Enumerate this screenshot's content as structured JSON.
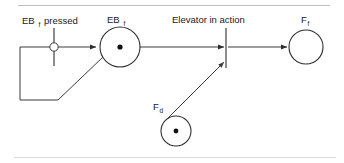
{
  "figure": {
    "type": "petri-net",
    "background_color": "#ffffff",
    "line_color": "#3b3b3b",
    "token_color": "#111111"
  },
  "labels": {
    "eb_pressed_base": "EB",
    "eb_pressed_sub": "f",
    "eb_pressed_rest": "pressed",
    "eb_place_base": "EB",
    "eb_place_sub": "f",
    "elevator_in_action": "Elevator in action",
    "ff_base": "F",
    "ff_sub": "f",
    "fd_base": "F",
    "fd_sub": "d"
  },
  "places": [
    {
      "id": "eb-f",
      "label_base": "EB",
      "label_sub": "f",
      "cx": 120,
      "cy": 47,
      "r": 20,
      "has_token": true
    },
    {
      "id": "f-f",
      "label_base": "F",
      "label_sub": "f",
      "cx": 306,
      "cy": 47,
      "r": 17,
      "has_token": false
    },
    {
      "id": "f-d",
      "label_base": "F",
      "label_sub": "d",
      "cx": 176,
      "cy": 131,
      "r": 15,
      "has_token": true
    }
  ],
  "transitions": [
    {
      "id": "eb-pressed",
      "label": "EB f pressed",
      "x": 54,
      "y_top": 28,
      "y_bottom": 66
    },
    {
      "id": "elevator-in-action",
      "label": "Elevator in action",
      "x": 226,
      "y_top": 28,
      "y_bottom": 68
    }
  ],
  "condition_marker": {
    "cx": 54,
    "cy": 47,
    "r": 4.2
  },
  "arcs": [
    {
      "id": "arc-cond-to-ebf",
      "from": "eb-pressed",
      "to": "eb-f",
      "arrow": true
    },
    {
      "id": "arc-ebf-to-action",
      "from": "eb-f",
      "to": "elevator-in-action",
      "arrow": true
    },
    {
      "id": "arc-action-to-ff",
      "from": "elevator-in-action",
      "to": "f-f",
      "arrow": true
    },
    {
      "id": "arc-fd-to-action",
      "from": "f-d",
      "to": "elevator-in-action",
      "arrow": true
    },
    {
      "id": "arc-feedback-loop",
      "from": "eb-f",
      "to": "eb-pressed",
      "arrow": false
    }
  ],
  "frame": {
    "top_rule": true,
    "bottom_rule": true
  }
}
